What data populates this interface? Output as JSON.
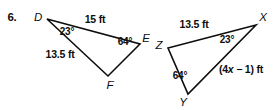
{
  "problem": {
    "number": "6."
  },
  "colors": {
    "ink": "#0d0d0d",
    "background": "#ffffff"
  },
  "triangle_left": {
    "name": "triangle-DEF",
    "vertices": [
      {
        "label": "D",
        "x": 47,
        "y": 19
      },
      {
        "label": "E",
        "x": 140,
        "y": 44
      },
      {
        "label": "F",
        "x": 108,
        "y": 76
      }
    ],
    "vertex_labels": [
      {
        "label": "D",
        "x": 38,
        "y": 18
      },
      {
        "label": "E",
        "x": 146,
        "y": 39
      },
      {
        "label": "F",
        "x": 110,
        "y": 85
      }
    ],
    "sides": [
      {
        "label": "15 ft",
        "x": 95,
        "y": 19,
        "between": "D-E"
      },
      {
        "label": "13.5 ft",
        "x": 60,
        "y": 54,
        "between": "D-F"
      }
    ],
    "angles": [
      {
        "label": "23°",
        "x": 67,
        "y": 32,
        "at": "D"
      },
      {
        "label": "64°",
        "x": 125,
        "y": 42,
        "at": "E"
      }
    ]
  },
  "triangle_right": {
    "name": "triangle-XYZ",
    "vertices": [
      {
        "label": "X",
        "x": 256,
        "y": 25
      },
      {
        "label": "Y",
        "x": 188,
        "y": 94
      },
      {
        "label": "Z",
        "x": 168,
        "y": 48
      }
    ],
    "vertex_labels": [
      {
        "label": "X",
        "x": 263,
        "y": 18
      },
      {
        "label": "Y",
        "x": 183,
        "y": 103
      },
      {
        "label": "Z",
        "x": 159,
        "y": 46
      }
    ],
    "sides": [
      {
        "label": "13.5 ft",
        "x": 194,
        "y": 24,
        "between": "Z-X"
      }
    ],
    "expression_side": {
      "prefix": "(4",
      "variable": "x",
      "suffix": " − 1) ft",
      "full": "(4x − 1) ft",
      "x": 241,
      "y": 69,
      "between": "X-Y"
    },
    "angles": [
      {
        "label": "23°",
        "x": 227,
        "y": 40,
        "at": "X"
      },
      {
        "label": "64°",
        "x": 180,
        "y": 76,
        "at": "Y"
      }
    ]
  }
}
